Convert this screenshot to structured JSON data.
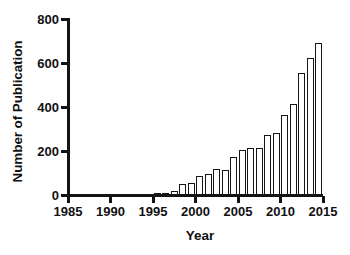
{
  "chart_data": {
    "type": "bar",
    "title": "",
    "xlabel": "Year",
    "ylabel": "Number of Publication",
    "xlim": [
      1985,
      2015
    ],
    "ylim": [
      0,
      800
    ],
    "ytick_labels": [
      "0",
      "200",
      "400",
      "600",
      "800"
    ],
    "yticks": [
      0,
      200,
      400,
      600,
      800
    ],
    "xtick_labels": [
      "1985",
      "1990",
      "1995",
      "2000",
      "2005",
      "2010",
      "2015"
    ],
    "xticks": [
      1985,
      1990,
      1995,
      2000,
      2005,
      2010,
      2015
    ],
    "grid": false,
    "legend": false,
    "bar_color": "#ffffff",
    "bar_edge_color": "#161616",
    "axis_color": "#141414",
    "categories": [
      1995,
      1996,
      1997,
      1998,
      1999,
      2000,
      2001,
      2002,
      2003,
      2004,
      2005,
      2006,
      2007,
      2008,
      2009,
      2010,
      2011,
      2012,
      2013,
      2014
    ],
    "values": [
      3,
      8,
      18,
      52,
      55,
      88,
      95,
      118,
      112,
      175,
      205,
      212,
      215,
      275,
      282,
      365,
      415,
      553,
      623,
      690
    ]
  }
}
